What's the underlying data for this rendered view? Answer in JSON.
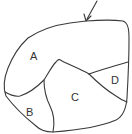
{
  "diagram": {
    "regions": [
      {
        "id": "A",
        "label": "A"
      },
      {
        "id": "B",
        "label": "B"
      },
      {
        "id": "C",
        "label": "C"
      },
      {
        "id": "D",
        "label": "D"
      }
    ],
    "arrow": {
      "target": "top boundary"
    },
    "colors": {
      "stroke": "#3a3a3a",
      "background": "#ffffff",
      "text": "#333333"
    }
  }
}
